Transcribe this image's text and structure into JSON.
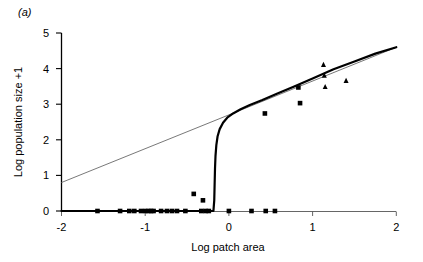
{
  "figure": {
    "panel_label": "(a)"
  },
  "chart_data": {
    "type": "scatter",
    "title": "",
    "xlabel": "Log patch area",
    "ylabel": "Log population size +1",
    "xlim": [
      -2,
      2
    ],
    "ylim": [
      0,
      5
    ],
    "xticks": [
      -2,
      -1,
      0,
      1,
      2
    ],
    "xticklabels": [
      "-2",
      "-1",
      "0",
      "1",
      "2"
    ],
    "yticks": [
      0,
      1,
      2,
      3,
      4,
      5
    ],
    "yticklabels": [
      "0",
      "1",
      "2",
      "3",
      "4",
      "5"
    ],
    "grid": false,
    "legend": "none",
    "series": [
      {
        "name": "squares",
        "marker": "square",
        "color": "#000000",
        "points": [
          [
            -1.57,
            0.0
          ],
          [
            -1.3,
            0.0
          ],
          [
            -1.19,
            0.0
          ],
          [
            -1.13,
            0.0
          ],
          [
            -1.05,
            0.0
          ],
          [
            -1.0,
            0.0
          ],
          [
            -0.96,
            0.0
          ],
          [
            -0.93,
            0.0
          ],
          [
            -0.9,
            0.0
          ],
          [
            -0.81,
            0.0
          ],
          [
            -0.74,
            0.0
          ],
          [
            -0.68,
            0.0
          ],
          [
            -0.62,
            0.0
          ],
          [
            -0.52,
            0.0
          ],
          [
            -0.33,
            0.0
          ],
          [
            -0.28,
            0.0
          ],
          [
            -0.24,
            0.0
          ],
          [
            0.0,
            0.0
          ],
          [
            0.27,
            0.0
          ],
          [
            0.44,
            0.0
          ],
          [
            0.55,
            0.0
          ],
          [
            -0.42,
            0.48
          ],
          [
            -0.31,
            0.3
          ],
          [
            0.43,
            2.74
          ],
          [
            0.83,
            3.47
          ],
          [
            0.85,
            3.03
          ]
        ]
      },
      {
        "name": "triangles",
        "marker": "triangle",
        "color": "#000000",
        "points": [
          [
            1.13,
            4.1
          ],
          [
            1.14,
            3.8
          ],
          [
            1.15,
            3.48
          ],
          [
            1.4,
            3.65
          ]
        ]
      }
    ],
    "lines": [
      {
        "name": "linear-regression",
        "style": "thin-grey",
        "color": "#555555",
        "width": 0.8,
        "points": [
          [
            -2.0,
            0.8
          ],
          [
            2.0,
            4.6
          ]
        ]
      },
      {
        "name": "threshold-model",
        "style": "thick-black",
        "color": "#000000",
        "width": 2.2,
        "points": [
          [
            -2.0,
            0.0
          ],
          [
            -0.6,
            0.0
          ],
          [
            -0.3,
            0.0
          ],
          [
            -0.2,
            0.0
          ],
          [
            -0.185,
            0.0
          ],
          [
            -0.175,
            0.3
          ],
          [
            -0.17,
            0.8
          ],
          [
            -0.166,
            1.2
          ],
          [
            -0.16,
            1.55
          ],
          [
            -0.15,
            1.85
          ],
          [
            -0.135,
            2.1
          ],
          [
            -0.11,
            2.3
          ],
          [
            -0.07,
            2.48
          ],
          [
            -0.02,
            2.62
          ],
          [
            0.05,
            2.74
          ],
          [
            0.14,
            2.86
          ],
          [
            0.25,
            2.98
          ],
          [
            0.4,
            3.12
          ],
          [
            0.58,
            3.3
          ],
          [
            0.78,
            3.5
          ],
          [
            1.0,
            3.72
          ],
          [
            1.25,
            3.98
          ],
          [
            1.5,
            4.2
          ],
          [
            1.75,
            4.42
          ],
          [
            2.0,
            4.6
          ]
        ]
      }
    ]
  }
}
